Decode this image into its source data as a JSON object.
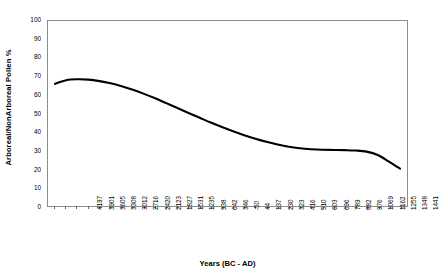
{
  "chart_data": {
    "type": "line",
    "title": "",
    "xlabel": "Years (BC - AD)",
    "ylabel": "Arboreal/NonArboreal Pollen %",
    "ylim": [
      0,
      100
    ],
    "ytick_labels": [
      "100",
      "90",
      "80",
      "70",
      "60",
      "50",
      "40",
      "30",
      "20",
      "10",
      "0"
    ],
    "ytick_values": [
      100,
      90,
      80,
      70,
      60,
      50,
      40,
      30,
      20,
      10,
      0
    ],
    "grid": false,
    "legend": "none",
    "series_color": "#000000",
    "categories": [
      "4197",
      "3901",
      "3605",
      "3308",
      "3012",
      "2716",
      "2420",
      "2123",
      "1827",
      "1531",
      "1235",
      "938",
      "642",
      "346",
      "-50",
      "44",
      "137",
      "230",
      "323",
      "416",
      "510",
      "603",
      "696",
      "789",
      "882",
      "976",
      "1069",
      "1162",
      "1255",
      "1348",
      "1441",
      "1535"
    ],
    "series": [
      {
        "name": "Arboreal/NonArboreal Pollen %",
        "values": [
          66.0,
          68.0,
          68.5,
          68.3,
          67.5,
          66.3,
          64.7,
          62.8,
          60.6,
          58.2,
          55.6,
          53.0,
          50.3,
          47.7,
          45.1,
          42.7,
          40.4,
          38.3,
          36.4,
          34.7,
          33.2,
          32.0,
          31.2,
          30.7,
          30.4,
          30.3,
          30.2,
          30.0,
          29.4,
          27.6,
          24.0,
          20.2
        ]
      }
    ]
  }
}
